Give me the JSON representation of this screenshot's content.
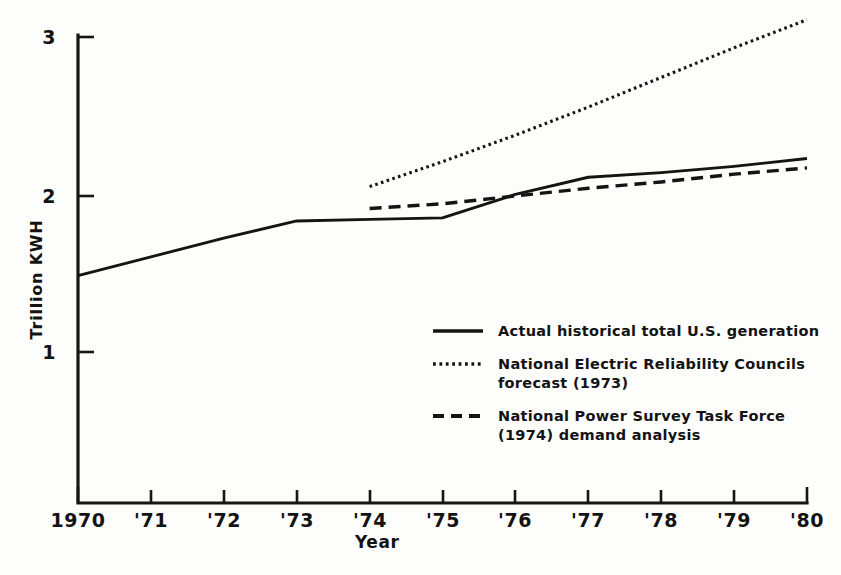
{
  "chart_data": {
    "type": "line",
    "title": "",
    "subtitle": "",
    "xlabel": "Year",
    "ylabel": "Trillion KWH",
    "xlim": [
      1970,
      1980
    ],
    "ylim": [
      0,
      3.22
    ],
    "grid": false,
    "legend_position": "center-right-inside",
    "y_ticks": [
      1,
      2,
      3
    ],
    "y_tick_labels": [
      "1",
      "2",
      "3"
    ],
    "x_ticks": [
      1970,
      1971,
      1972,
      1973,
      1974,
      1975,
      1976,
      1977,
      1978,
      1979,
      1980
    ],
    "x_tick_labels": [
      "1970",
      "'71",
      "'72",
      "'73",
      "'74",
      "'75",
      "'76",
      "'77",
      "'78",
      "'79",
      "'80"
    ],
    "series": [
      {
        "name": "Actual historical total U.S. generation",
        "style": "solid",
        "x": [
          1970,
          1971,
          1972,
          1973,
          1974,
          1975,
          1976,
          1977,
          1978,
          1979,
          1980
        ],
        "values": [
          1.49,
          1.61,
          1.73,
          1.84,
          1.85,
          1.86,
          2.01,
          2.12,
          2.15,
          2.19,
          2.24
        ]
      },
      {
        "name": "National Electric Reliability Councils forecast (1973)",
        "style": "dotted",
        "x": [
          1974,
          1975,
          1976,
          1977,
          1978,
          1979,
          1980
        ],
        "values": [
          2.06,
          2.22,
          2.39,
          2.57,
          2.76,
          2.95,
          3.13
        ]
      },
      {
        "name": "National Power Survey Task Force (1974) demand analysis",
        "style": "dashed",
        "x": [
          1974,
          1975,
          1976,
          1977,
          1978,
          1979,
          1980
        ],
        "values": [
          1.92,
          1.95,
          2.0,
          2.05,
          2.09,
          2.14,
          2.18
        ]
      }
    ]
  },
  "axes": {
    "y_title": "Trillion KWH",
    "x_title": "Year",
    "y_tick_labels": [
      "3",
      "2",
      "1"
    ],
    "x_tick_labels": [
      "1970",
      "'71",
      "'72",
      "'73",
      "'74",
      "'75",
      "'76",
      "'77",
      "'78",
      "'79",
      "'80"
    ]
  },
  "legend": {
    "entries": [
      {
        "label": "Actual  historical  total U.S. generation",
        "swatch": "solid-line-swatch"
      },
      {
        "label": "National Electric Reliability Councils\nforecast (1973)",
        "swatch": "dotted-line-swatch"
      },
      {
        "label": "National Power Survey Task Force\n(1974) demand analysis",
        "swatch": "dashed-line-swatch"
      }
    ]
  },
  "colors": {
    "ink": "#141414",
    "paper": "#fdfdfb"
  }
}
